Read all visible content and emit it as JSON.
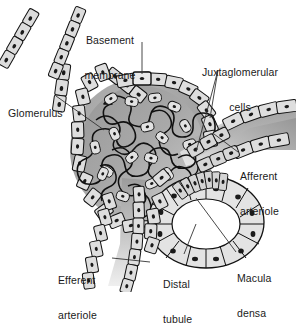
{
  "figure": {
    "type": "anatomical-diagram",
    "style": "grayscale line drawing with shaded cells"
  },
  "labels": [
    {
      "id": "basement-membrane",
      "text": "Basement\nmembrane",
      "line1": "Basement",
      "line2": "membrane",
      "x": 110,
      "y": 12,
      "align": "center",
      "leader": "vertical line down to the glomerular capsule wall"
    },
    {
      "id": "juxtaglomerular-cells",
      "text": "Juxtaglomerular\ncells",
      "line1": "Juxtaglomerular",
      "line2": "cells",
      "x": 190,
      "y": 44,
      "align": "center",
      "leader": "forked leader to two cell clusters beside the afferent arteriole"
    },
    {
      "id": "glomerulus",
      "text": "Glomerulus",
      "line1": "Glomerulus",
      "line2": "",
      "x": 8,
      "y": 85,
      "align": "left",
      "leader": "diagonal line to the capillary tuft"
    },
    {
      "id": "afferent-arteriole",
      "text": "Afferent\narteriole",
      "line1": "Afferent",
      "line2": "arteriole",
      "x": 240,
      "y": 148,
      "align": "left",
      "leader": "short diagonal line up-left to the arteriole"
    },
    {
      "id": "macula-densa",
      "text": "Macula\ndensa",
      "line1": "Macula",
      "line2": "densa",
      "x": 237,
      "y": 250,
      "align": "left",
      "leader": "diagonal line up-left into the distal tubule wall"
    },
    {
      "id": "efferent-arteriole",
      "text": "Efferent\narteriole",
      "line1": "Efferent",
      "line2": "arteriole",
      "x": 58,
      "y": 252,
      "align": "left",
      "leader": "horizontal line right to the descending arteriole"
    },
    {
      "id": "distal-tubule",
      "text": "Distal\ntubule",
      "line1": "Distal",
      "line2": "tubule",
      "x": 163,
      "y": 256,
      "align": "left",
      "leader": "vertical line up to the tubule ring"
    }
  ],
  "structures": [
    {
      "id": "bowmans-capsule-upper-limb-left",
      "name": "Bowman's capsule upper limb (left)"
    },
    {
      "id": "bowmans-capsule-upper-limb-right",
      "name": "Bowman's capsule upper limb (right)"
    },
    {
      "id": "bowmans-capsule-ring",
      "name": "Bowman's capsule cell ring"
    },
    {
      "id": "glomerular-capillary-tuft",
      "name": "Glomerular capillary tuft"
    },
    {
      "id": "basement-membrane-band",
      "name": "Basement membrane band"
    },
    {
      "id": "afferent-arteriole-vessel",
      "name": "Afferent arteriole"
    },
    {
      "id": "efferent-arteriole-vessel",
      "name": "Efferent arteriole"
    },
    {
      "id": "juxtaglomerular-cell-cluster",
      "name": "Juxtaglomerular cell cluster"
    },
    {
      "id": "distal-tubule-ring",
      "name": "Distal tubule ring"
    },
    {
      "id": "macula-densa-cells",
      "name": "Macula densa tall cells"
    }
  ],
  "colors": {
    "background": "#ffffff",
    "outline": "#111111",
    "cell_fill": "#dddddd",
    "cell_fill_light": "#e8e8e8",
    "nucleus": "#1a1a1a",
    "tuft_matrix_dark": "#8f8f8f",
    "tuft_matrix_light": "#c9c9c9",
    "lumen_dark": "#8a8a8a",
    "lumen_light": "#ededed",
    "label_text": "#1a1a1a",
    "leader_line": "#333333"
  }
}
